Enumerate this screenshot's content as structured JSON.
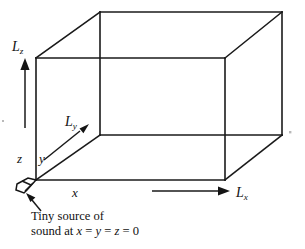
{
  "figure": {
    "kind": "3d-rectangular-room-diagram",
    "background_color": "#ffffff",
    "stroke_color": "#1a1a1a"
  },
  "labels": {
    "L_z": {
      "base": "L",
      "sub": "z"
    },
    "L_y": {
      "base": "L",
      "sub": "y"
    },
    "L_x": {
      "base": "L",
      "sub": "x"
    },
    "axis_z": "z",
    "axis_y": "y",
    "axis_x": "x"
  },
  "caption": {
    "line1": "Tiny source of",
    "line2_prefix": "sound at ",
    "line2_var_x": "x",
    "line2_eq1": " = ",
    "line2_var_y": "y",
    "line2_eq2": " = ",
    "line2_var_z": "z",
    "line2_eq3": " = ",
    "line2_value": "0"
  },
  "geometry": {
    "front_face": {
      "x1": 36,
      "y1": 58,
      "x2": 225,
      "y2": 180
    },
    "back_face": {
      "x1": 100,
      "y1": 12,
      "x2": 282,
      "y2": 136
    },
    "arrows": {
      "Lz": {
        "from": [
          25,
          128
        ],
        "to": [
          25,
          62
        ]
      },
      "Ly": {
        "from": [
          44,
          159
        ],
        "to": [
          88,
          124
        ]
      },
      "Lx": {
        "from": [
          152,
          190
        ],
        "to": [
          228,
          190
        ]
      },
      "source_pointer": {
        "from": [
          42,
          212
        ],
        "to": [
          28,
          196
        ]
      }
    }
  }
}
